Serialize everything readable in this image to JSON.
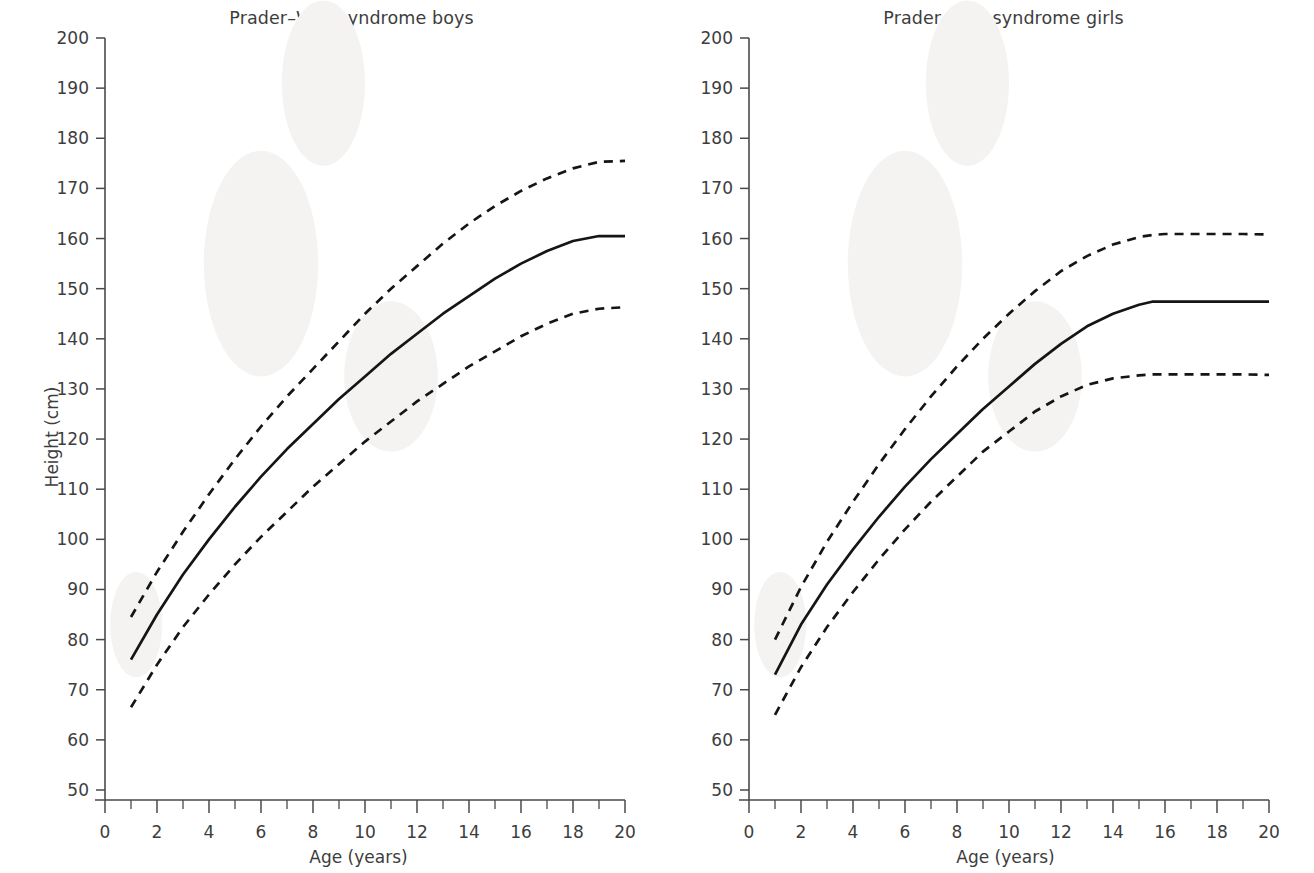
{
  "figure": {
    "axis_color": "#4a4a4a",
    "curve_color": "#151515",
    "background": "#ffffff"
  },
  "panels": [
    {
      "id": "boys",
      "title": "Prader–Willi syndrome boys",
      "xlabel": "Age (years)",
      "ylabel": "Height (cm)"
    },
    {
      "id": "girls",
      "title": "Prader–Willi syndrome girls",
      "xlabel": "Age (years)",
      "ylabel": "Height (cm)"
    }
  ],
  "axes": {
    "y_ticks": [
      200,
      190,
      180,
      170,
      160,
      150,
      140,
      130,
      120,
      110,
      100,
      90,
      80,
      70,
      60,
      50
    ],
    "x_ticks": [
      0,
      2,
      4,
      6,
      8,
      10,
      12,
      14,
      16,
      18,
      20
    ],
    "x_minor_ticks": [
      1,
      3,
      5,
      7,
      9,
      11,
      13,
      15,
      17,
      19
    ],
    "ylim": [
      50,
      200
    ],
    "xlim": [
      0,
      20
    ]
  },
  "chart_data": [
    {
      "type": "line",
      "title": "Prader–Willi syndrome boys",
      "xlabel": "Age (years)",
      "ylabel": "Height (cm)",
      "xlim": [
        0,
        20
      ],
      "ylim": [
        50,
        200
      ],
      "grid": false,
      "legend": "none",
      "x": [
        1,
        2,
        3,
        4,
        5,
        6,
        7,
        8,
        9,
        10,
        11,
        12,
        13,
        14,
        15,
        16,
        17,
        18,
        19,
        20
      ],
      "series": [
        {
          "name": "+2 SD (upper dashed)",
          "style": "dashed",
          "values": [
            84.5,
            93.5,
            101.5,
            109.0,
            116.0,
            122.5,
            128.5,
            134.0,
            139.5,
            145.0,
            150.0,
            154.5,
            159.0,
            163.0,
            166.5,
            169.5,
            172.0,
            174.0,
            175.3,
            175.5
          ]
        },
        {
          "name": "Median (solid)",
          "style": "solid",
          "values": [
            76.0,
            85.0,
            93.0,
            100.0,
            106.5,
            112.5,
            118.0,
            123.0,
            128.0,
            132.5,
            137.0,
            141.0,
            145.0,
            148.5,
            152.0,
            155.0,
            157.5,
            159.5,
            160.5,
            160.5
          ]
        },
        {
          "name": "−2 SD (lower dashed)",
          "style": "dashed",
          "values": [
            66.5,
            75.0,
            82.5,
            89.0,
            95.0,
            100.5,
            105.5,
            110.5,
            115.0,
            119.5,
            123.5,
            127.5,
            131.0,
            134.5,
            137.5,
            140.5,
            143.0,
            145.0,
            146.0,
            146.3
          ]
        }
      ]
    },
    {
      "type": "line",
      "title": "Prader–Willi syndrome girls",
      "xlabel": "Age (years)",
      "ylabel": "Height (cm)",
      "xlim": [
        0,
        20
      ],
      "ylim": [
        50,
        200
      ],
      "grid": false,
      "legend": "none",
      "x": [
        1,
        2,
        3,
        4,
        5,
        6,
        7,
        8,
        9,
        10,
        11,
        12,
        13,
        14,
        15,
        15.5,
        16,
        17,
        18,
        19,
        20
      ],
      "series": [
        {
          "name": "+2 SD (upper dashed)",
          "style": "dashed",
          "values": [
            80.0,
            90.5,
            99.5,
            107.5,
            115.0,
            122.0,
            128.5,
            134.5,
            140.0,
            145.0,
            149.5,
            153.5,
            156.5,
            158.8,
            160.3,
            160.7,
            160.9,
            160.9,
            160.9,
            160.9,
            160.8
          ]
        },
        {
          "name": "Median (solid)",
          "style": "solid",
          "values": [
            73.0,
            83.0,
            91.0,
            98.0,
            104.5,
            110.5,
            116.0,
            121.0,
            126.0,
            130.5,
            135.0,
            139.0,
            142.5,
            145.0,
            146.8,
            147.4,
            147.4,
            147.4,
            147.4,
            147.4,
            147.4
          ]
        },
        {
          "name": "−2 SD (lower dashed)",
          "style": "dashed",
          "values": [
            65.0,
            74.5,
            82.5,
            89.5,
            96.0,
            102.0,
            107.5,
            112.5,
            117.5,
            121.5,
            125.5,
            128.5,
            130.8,
            132.1,
            132.7,
            132.9,
            132.9,
            132.9,
            132.9,
            132.9,
            132.8
          ]
        }
      ]
    }
  ]
}
